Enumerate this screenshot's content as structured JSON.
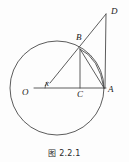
{
  "figure": {
    "caption": "图 2.2.1",
    "stroke_color": "#4a4a4a",
    "label_color": "#1a1a1a",
    "background": "#fdfdfd"
  },
  "labels": {
    "O": "O",
    "A": "A",
    "B": "B",
    "C": "C",
    "D": "D",
    "angle": "x"
  },
  "geometry": {
    "type": "circle-tangent-diagram",
    "circle": {
      "cx": 57,
      "cy": 88,
      "r": 47
    },
    "points": {
      "O": {
        "x": 57,
        "y": 88
      },
      "A": {
        "x": 104,
        "y": 88
      },
      "B": {
        "x": 80,
        "y": 48
      },
      "C": {
        "x": 80,
        "y": 88
      },
      "D": {
        "x": 106,
        "y": 14
      }
    },
    "segments": [
      {
        "name": "OA",
        "from": "O",
        "to": "A"
      },
      {
        "name": "OD",
        "from": "O",
        "to": "D"
      },
      {
        "name": "BC",
        "from": "B",
        "to": "C"
      },
      {
        "name": "BA",
        "from": "B",
        "to": "A"
      },
      {
        "name": "AD",
        "from": "A",
        "to": "D"
      }
    ],
    "angle_mark": {
      "at": "O",
      "label": "x",
      "between": [
        "OA",
        "OD"
      ]
    }
  }
}
